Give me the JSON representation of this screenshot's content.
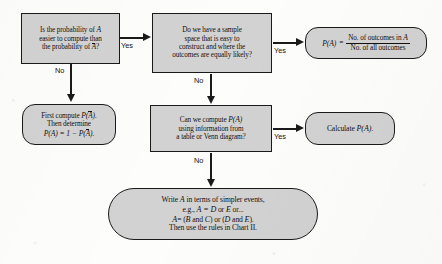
{
  "chart": {
    "fill_color": "#d2d2d2",
    "line_color": "#1a1a1a"
  },
  "nodes": {
    "q1": {
      "shape": "rectangle",
      "line1": "Is the probability of",
      "var1": "A",
      "line2": "easier to compute than",
      "line3": "the probability of",
      "var2": "A",
      "line3_end": "?"
    },
    "q2": {
      "shape": "rectangle",
      "line1": "Do we have a sample",
      "line2": "space that is easy to",
      "line3": "construct and where the",
      "line4": "outcomes are equally likely?"
    },
    "classical": {
      "shape": "rounded",
      "lhs": "P(A)",
      "equals": "=",
      "numerator": "No. of outcomes in",
      "numerator_var": "A",
      "denominator": "No. of all outcomes"
    },
    "complement": {
      "shape": "rounded",
      "line1_pre": "First compute",
      "line1_p": "P(",
      "line1_var": "A",
      "line1_post": ").",
      "line2": "Then determine",
      "line3_a": "P(A) = 1 − P(",
      "line3_var": "A",
      "line3_b": ")."
    },
    "q3": {
      "shape": "rectangle",
      "line1": "Can we compute",
      "line1_var": "P(A)",
      "line2": "using information from",
      "line3": "a table or Venn diagram?"
    },
    "calculate": {
      "shape": "rounded",
      "label": "Calculate",
      "label_var": "P(A)",
      "label_end": "."
    },
    "decompose": {
      "shape": "stadium",
      "line1_a": "Write",
      "line1_var": "A",
      "line1_b": "in terms of simpler events,",
      "line2_a": "e.g.,",
      "line2_var": "A = D",
      "line2_mid": "or",
      "line2_var2": "E",
      "line2_b": "or...",
      "line3_a": "A",
      "line3_b": "= (",
      "line3_v1": "B",
      "line3_c": "and",
      "line3_v2": "C",
      "line3_d": ") or (",
      "line3_v3": "D",
      "line3_e": "and",
      "line3_v4": "E",
      "line3_f": ").",
      "line4": "Then use the rules in Chart II."
    }
  },
  "edges": [
    {
      "id": "q1-yes",
      "label": "Yes",
      "from": "q1",
      "to": "q2"
    },
    {
      "id": "q1-no",
      "label": "No",
      "from": "q1",
      "to": "complement"
    },
    {
      "id": "q2-yes",
      "label": "Yes",
      "from": "q2",
      "to": "classical"
    },
    {
      "id": "q2-no",
      "label": "No",
      "from": "q2",
      "to": "q3"
    },
    {
      "id": "q3-yes",
      "label": "Yes",
      "from": "q3",
      "to": "calculate"
    },
    {
      "id": "q3-no",
      "label": "No",
      "from": "q3",
      "to": "decompose"
    }
  ]
}
